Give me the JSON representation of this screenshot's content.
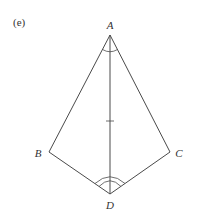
{
  "figure": {
    "subfigure_label": "(e)",
    "colors": {
      "stroke": "#4a4a4a",
      "text": "#333333",
      "background": "#ffffff"
    },
    "vertices": [
      {
        "name": "A",
        "x": 110,
        "y": 35,
        "label_x": 110,
        "label_y": 29
      },
      {
        "name": "B",
        "x": 49,
        "y": 152,
        "label_x": 38,
        "label_y": 157
      },
      {
        "name": "C",
        "x": 170,
        "y": 152,
        "label_x": 179,
        "label_y": 157
      },
      {
        "name": "D",
        "x": 110,
        "y": 194,
        "label_x": 110,
        "label_y": 209
      }
    ],
    "segments": [
      "AB",
      "AC",
      "BD",
      "CD",
      "AD"
    ],
    "markings": {
      "equal_angles_at_A": "single arc",
      "equal_angles_at_D": "double arc",
      "tick_on_AD": "single tick"
    }
  }
}
